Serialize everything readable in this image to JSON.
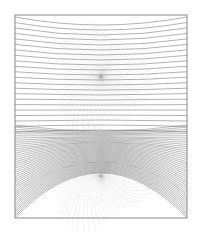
{
  "figure": {
    "background": "#ffffff",
    "frame": {
      "x": 15,
      "y": 15,
      "width": 172,
      "height": 203,
      "stroke": "#888888"
    },
    "upper_family": {
      "focus": [
        101,
        77
      ],
      "curve_count": 22,
      "stroke": "#555555",
      "opacity": 0.75
    },
    "lower_family": {
      "focus": [
        101,
        176
      ],
      "curve_count": 44,
      "stroke": "#444444",
      "opacity": 0.7
    },
    "petals": {
      "stroke": "#999999",
      "opacity": 0.25,
      "ray_count": 60
    }
  }
}
